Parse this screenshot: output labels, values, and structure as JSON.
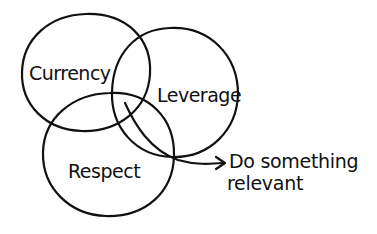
{
  "diagram": {
    "type": "venn",
    "sets": [
      {
        "id": "currency",
        "label": "Currency"
      },
      {
        "id": "leverage",
        "label": "Leverage"
      },
      {
        "id": "respect",
        "label": "Respect"
      }
    ],
    "intersection_callout": {
      "target": [
        "currency",
        "leverage",
        "respect"
      ],
      "line1": "Do something",
      "line2": "relevant"
    },
    "stroke_color": "#111111",
    "background_color": "#ffffff"
  }
}
